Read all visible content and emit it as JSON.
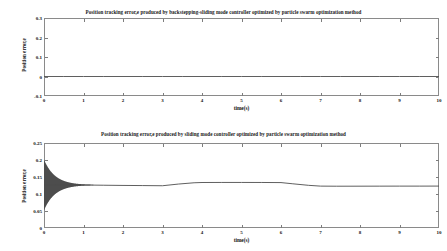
{
  "figure": {
    "width": 447,
    "height": 251,
    "background": "#ffffff",
    "line_color": "#4d4d4d",
    "axis_color": "#8a8a8a"
  },
  "charts": [
    {
      "id": "top",
      "type": "line",
      "title": "Position tracking error,e produced by backstepping-sliding mode controller optimized by particle swarm optimization method",
      "xlabel": "time(s)",
      "ylabel": "Position error,e",
      "xlim": [
        0,
        10
      ],
      "ylim": [
        -0.1,
        0.3
      ],
      "xticks": [
        0,
        1,
        2,
        3,
        4,
        5,
        6,
        7,
        8,
        9,
        10
      ],
      "xticklabels": [
        "0",
        "1",
        "2",
        "3",
        "4",
        "5",
        "6",
        "7",
        "8",
        "9",
        "10"
      ],
      "yticks": [
        -0.1,
        0,
        0.1,
        0.2,
        0.3
      ],
      "yticklabels": [
        "-0.1",
        "0",
        "0.1",
        "0.2",
        "0.3"
      ],
      "grid": false,
      "legend": null,
      "series": [
        {
          "name": "error e",
          "x": [
            0,
            0.5,
            1,
            1.5,
            2,
            2.5,
            3,
            3.5,
            4,
            4.5,
            5,
            5.5,
            6,
            6.5,
            7,
            7.5,
            8,
            8.5,
            9,
            9.5,
            10
          ],
          "values": [
            0,
            0,
            0,
            0,
            0,
            0,
            0,
            0,
            0,
            0,
            0,
            0,
            0,
            0,
            0,
            0,
            0,
            0,
            0,
            0,
            0
          ]
        }
      ]
    },
    {
      "id": "bottom",
      "type": "line",
      "title": "Position tracking error,e produced by sliding mode controller optimized by particle swarm optimization method",
      "xlabel": "time(s)",
      "ylabel": "Position error,e",
      "xlim": [
        0,
        10
      ],
      "ylim": [
        0,
        0.25
      ],
      "xticks": [
        0,
        1,
        2,
        3,
        4,
        5,
        6,
        7,
        8,
        9,
        10
      ],
      "xticklabels": [
        "0",
        "1",
        "2",
        "3",
        "4",
        "5",
        "6",
        "7",
        "8",
        "9",
        "10"
      ],
      "yticks": [
        0,
        0.05,
        0.1,
        0.15,
        0.2,
        0.25
      ],
      "yticklabels": [
        "0",
        "0.05",
        "0.1",
        "0.15",
        "0.2",
        "0.25"
      ],
      "grid": false,
      "legend": null,
      "chatter": {
        "description": "high-frequency chattering band decaying from t=0 to t~1.2",
        "t_start": 0,
        "t_end": 1.25,
        "upper_start": 0.201,
        "lower_start": 0.052,
        "center": 0.1265,
        "decay_rate": 3.6
      },
      "series": [
        {
          "name": "error e (mean)",
          "x": [
            0,
            0.3,
            0.6,
            0.9,
            1.2,
            1.5,
            2.0,
            2.5,
            3.0,
            3.4,
            3.8,
            4.0,
            4.5,
            5.0,
            5.5,
            6.0,
            6.3,
            6.7,
            7.0,
            7.4,
            8.0,
            8.5,
            9.0,
            9.5,
            10
          ],
          "values": [
            0.1265,
            0.1265,
            0.1265,
            0.1265,
            0.1262,
            0.1258,
            0.1252,
            0.1248,
            0.1243,
            0.1292,
            0.133,
            0.1338,
            0.134,
            0.134,
            0.1339,
            0.1336,
            0.13,
            0.1255,
            0.1232,
            0.1229,
            0.123,
            0.1231,
            0.1232,
            0.1232,
            0.1233
          ]
        }
      ]
    }
  ]
}
